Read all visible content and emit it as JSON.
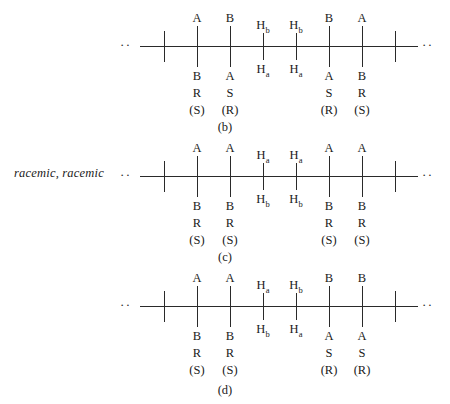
{
  "annotation": {
    "racemic_label": "racemic, racemic"
  },
  "ellipsis": {
    "left": "··",
    "right": "··"
  },
  "figures": [
    {
      "id": "b",
      "caption": "(b)",
      "has_side_note": false,
      "sites": [
        {
          "kind": "cap",
          "x": 36
        },
        {
          "kind": "long",
          "x": 69,
          "top": "A",
          "bottom": "B",
          "cip": "R",
          "paren": "(S)"
        },
        {
          "kind": "long",
          "x": 102,
          "top": "B",
          "bottom": "A",
          "cip": "S",
          "paren": "(R)"
        },
        {
          "kind": "short",
          "x": 135,
          "top": "H",
          "top_sub": "b",
          "bottom": "H",
          "bottom_sub": "a",
          "cip": "",
          "paren": ""
        },
        {
          "kind": "short",
          "x": 168,
          "top": "H",
          "top_sub": "b",
          "bottom": "H",
          "bottom_sub": "a",
          "cip": "",
          "paren": ""
        },
        {
          "kind": "long",
          "x": 201,
          "top": "B",
          "bottom": "A",
          "cip": "S",
          "paren": "(R)"
        },
        {
          "kind": "long",
          "x": 234,
          "top": "A",
          "bottom": "B",
          "cip": "R",
          "paren": "(S)"
        },
        {
          "kind": "cap",
          "x": 267
        }
      ]
    },
    {
      "id": "c",
      "caption": "(c)",
      "has_side_note": true,
      "sites": [
        {
          "kind": "cap",
          "x": 36
        },
        {
          "kind": "long",
          "x": 69,
          "top": "A",
          "bottom": "B",
          "cip": "R",
          "paren": "(S)"
        },
        {
          "kind": "long",
          "x": 102,
          "top": "A",
          "bottom": "B",
          "cip": "R",
          "paren": "(S)"
        },
        {
          "kind": "short",
          "x": 135,
          "top": "H",
          "top_sub": "a",
          "bottom": "H",
          "bottom_sub": "b",
          "cip": "",
          "paren": ""
        },
        {
          "kind": "short",
          "x": 168,
          "top": "H",
          "top_sub": "a",
          "bottom": "H",
          "bottom_sub": "b",
          "cip": "",
          "paren": ""
        },
        {
          "kind": "long",
          "x": 201,
          "top": "A",
          "bottom": "B",
          "cip": "R",
          "paren": "(S)"
        },
        {
          "kind": "long",
          "x": 234,
          "top": "A",
          "bottom": "B",
          "cip": "R",
          "paren": "(S)"
        },
        {
          "kind": "cap",
          "x": 267
        }
      ]
    },
    {
      "id": "d",
      "caption": "(d)",
      "has_side_note": false,
      "sites": [
        {
          "kind": "cap",
          "x": 36
        },
        {
          "kind": "long",
          "x": 69,
          "top": "A",
          "bottom": "B",
          "cip": "R",
          "paren": "(S)"
        },
        {
          "kind": "long",
          "x": 102,
          "top": "A",
          "bottom": "B",
          "cip": "R",
          "paren": "(S)"
        },
        {
          "kind": "short",
          "x": 135,
          "top": "H",
          "top_sub": "a",
          "bottom": "H",
          "bottom_sub": "b",
          "cip": "",
          "paren": ""
        },
        {
          "kind": "short",
          "x": 168,
          "top": "H",
          "top_sub": "b",
          "bottom": "H",
          "bottom_sub": "a",
          "cip": "",
          "paren": ""
        },
        {
          "kind": "long",
          "x": 201,
          "top": "B",
          "bottom": "A",
          "cip": "S",
          "paren": "(R)"
        },
        {
          "kind": "long",
          "x": 234,
          "top": "B",
          "bottom": "A",
          "cip": "S",
          "paren": "(R)"
        },
        {
          "kind": "cap",
          "x": 267
        }
      ]
    }
  ],
  "colors": {
    "ink": "#1a1a1a",
    "line": "#2a2a2a",
    "background": "#ffffff"
  }
}
